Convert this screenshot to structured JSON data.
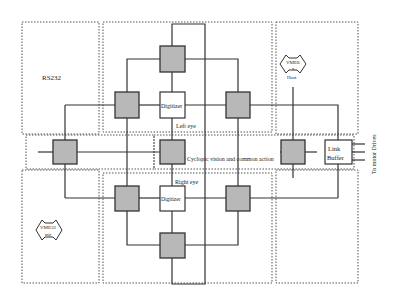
{
  "diagram": {
    "labels": {
      "rs232": "RS232",
      "digitizer_left": "Digitizer",
      "digitizer_right": "Digitizer",
      "left_eye": "Left eye",
      "right_eye": "Right eye",
      "cyclopic": "Cyclopic vision and common action",
      "link": "Link",
      "buffer": "Buffer",
      "to_motor": "To motor Drives",
      "vme8_top": "VME8",
      "vme8_mid": "x",
      "host": "Host",
      "vme32_top": "VME32",
      "vme32_bot": "mit"
    },
    "colors": {
      "processor_fill": "#b8b8b8",
      "line": "#333333",
      "dotted": "#555555"
    }
  }
}
